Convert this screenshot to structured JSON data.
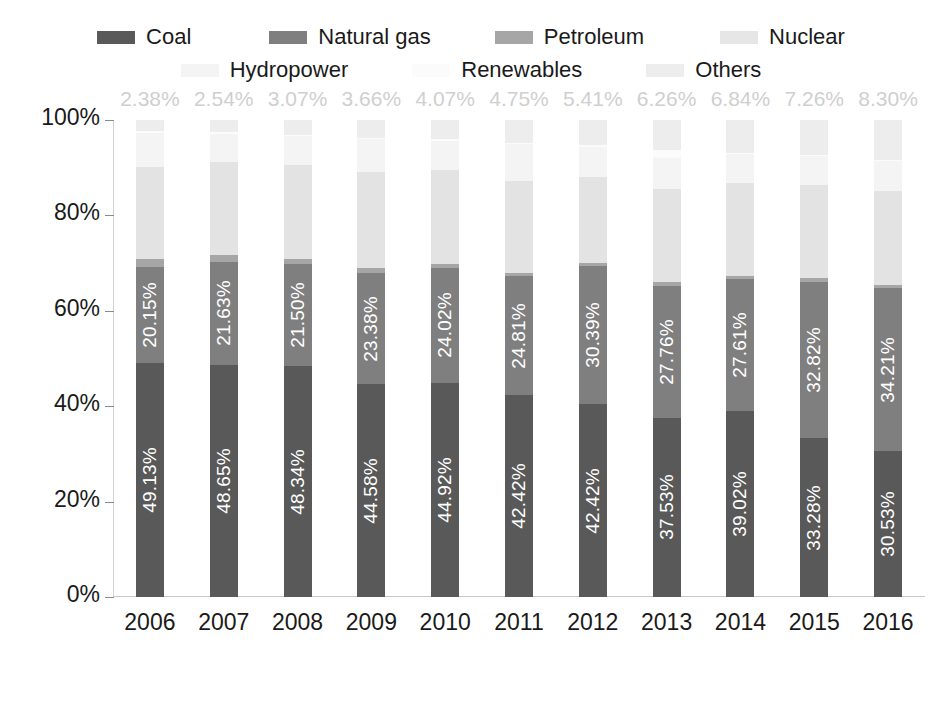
{
  "chart_data": {
    "type": "bar",
    "stacked": true,
    "title": "",
    "subtitle": "",
    "xlabel": "",
    "ylabel": "",
    "ylim": [
      0,
      100
    ],
    "ytick_labels": [
      "0%",
      "20%",
      "40%",
      "60%",
      "80%",
      "100%"
    ],
    "ytick_values": [
      0,
      20,
      40,
      60,
      80,
      100
    ],
    "grid": false,
    "legend_position": "top",
    "categories": [
      "2006",
      "2007",
      "2008",
      "2009",
      "2010",
      "2011",
      "2012",
      "2013",
      "2014",
      "2015",
      "2016"
    ],
    "series": [
      {
        "name": "Coal",
        "color": "#595959",
        "label_color": "#ffffff",
        "labels_shown": true,
        "values": [
          49.13,
          48.65,
          48.34,
          44.58,
          44.92,
          42.42,
          42.42,
          37.53,
          39.02,
          33.28,
          30.53
        ],
        "value_labels": [
          "49.13%",
          "48.65%",
          "48.34%",
          "44.58%",
          "44.92%",
          "42.42%",
          "42.42%",
          "37.53%",
          "39.02%",
          "33.28%",
          "30.53%"
        ]
      },
      {
        "name": "Natural gas",
        "color": "#7f7f7f",
        "label_color": "#ffffff",
        "labels_shown": true,
        "values": [
          20.15,
          21.63,
          21.5,
          23.38,
          24.02,
          24.81,
          30.39,
          27.76,
          27.61,
          32.82,
          34.21
        ],
        "value_labels": [
          "20.15%",
          "21.63%",
          "21.50%",
          "23.38%",
          "24.02%",
          "24.81%",
          "30.39%",
          "27.76%",
          "27.61%",
          "32.82%",
          "34.21%"
        ]
      },
      {
        "name": "Petroleum",
        "color": "#a6a6a6",
        "labels_shown": false,
        "values": [
          1.56,
          1.43,
          1.1,
          1.04,
          0.92,
          0.72,
          0.61,
          0.72,
          0.77,
          0.74,
          0.61
        ],
        "value_labels": []
      },
      {
        "name": "Nuclear",
        "color": "#e3e3e3",
        "labels_shown": false,
        "values": [
          19.37,
          19.42,
          19.56,
          20.21,
          19.57,
          19.28,
          18.99,
          19.44,
          19.47,
          19.55,
          19.73
        ],
        "value_labels": []
      },
      {
        "name": "Hydropower",
        "color": "#f4f4f4",
        "labels_shown": false,
        "values": [
          7.05,
          6.02,
          6.18,
          6.77,
          6.21,
          7.67,
          6.74,
          6.6,
          6.0,
          6.06,
          6.47
        ],
        "value_labels": []
      },
      {
        "name": "Renewables",
        "color": "#fbfbfb",
        "labels_shown": false,
        "values": [
          0.36,
          0.31,
          0.25,
          0.36,
          0.29,
          0.35,
          0.44,
          1.69,
          0.29,
          0.29,
          0.15
        ],
        "value_labels": []
      },
      {
        "name": "Others",
        "color": "#ededed",
        "label_color": "#cfcfcf",
        "labels_shown": true,
        "values": [
          2.38,
          2.54,
          3.07,
          3.66,
          4.07,
          4.75,
          5.41,
          6.26,
          6.84,
          7.26,
          8.3
        ],
        "value_labels": [
          "2.38%",
          "2.54%",
          "3.07%",
          "3.66%",
          "4.07%",
          "4.75%",
          "5.41%",
          "6.26%",
          "6.84%",
          "7.26%",
          "8.30%"
        ]
      }
    ]
  },
  "legend": {
    "rows": [
      [
        {
          "label": "Coal",
          "color": "#595959"
        },
        {
          "label": "Natural gas",
          "color": "#7f7f7f"
        },
        {
          "label": "Petroleum",
          "color": "#a6a6a6"
        },
        {
          "label": "Nuclear",
          "color": "#e6e6e6"
        }
      ],
      [
        {
          "label": "Hydropower",
          "color": "#f4f4f4"
        },
        {
          "label": "Renewables",
          "color": "#fbfbfb"
        },
        {
          "label": "Others",
          "color": "#ededed"
        }
      ]
    ]
  },
  "axes": {
    "y_ticks": [
      "100%",
      "80%",
      "60%",
      "40%",
      "20%",
      "0%"
    ],
    "x_ticks": [
      "2006",
      "2007",
      "2008",
      "2009",
      "2010",
      "2011",
      "2012",
      "2013",
      "2014",
      "2015",
      "2016"
    ]
  }
}
